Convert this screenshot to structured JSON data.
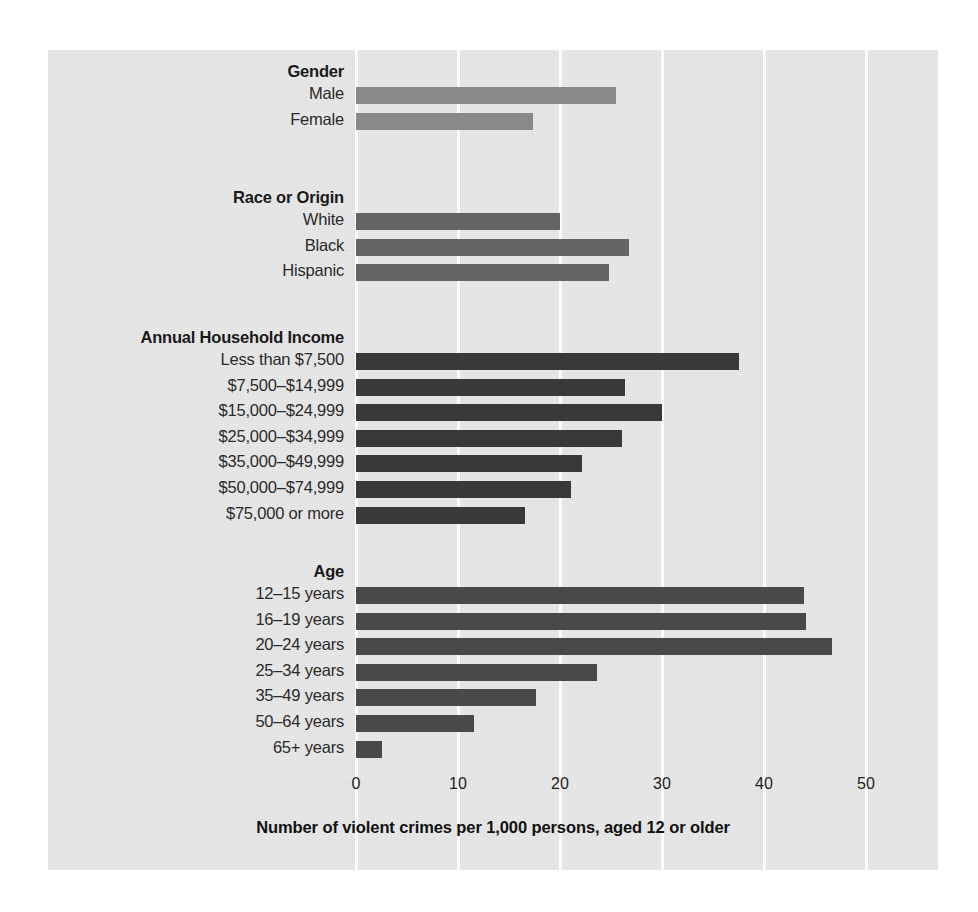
{
  "chart_data": {
    "type": "bar",
    "orientation": "horizontal",
    "title": "",
    "xlabel": "Number of violent crimes per 1,000 persons, aged 12 or older",
    "ylabel": "",
    "xlim": [
      0,
      55
    ],
    "xticks": [
      0,
      10,
      20,
      30,
      40,
      50
    ],
    "xtick_labels": [
      "0",
      "10",
      "20",
      "30",
      "40",
      "50"
    ],
    "grid": "vertical-white-gridlines",
    "legend": "none",
    "background": "#e9e9e9",
    "groups": [
      {
        "name": "Gender",
        "color": "#8c8c8c",
        "categories": [
          "Male",
          "Female"
        ],
        "values": [
          25.5,
          17.4
        ]
      },
      {
        "name": "Race or Origin",
        "color": "#666666",
        "categories": [
          "White",
          "Black",
          "Hispanic"
        ],
        "values": [
          20.0,
          26.8,
          24.8
        ]
      },
      {
        "name": "Annual Household Income",
        "color": "#3a3a3a",
        "categories": [
          "Less than $7,500",
          "$7,500–$14,999",
          "$15,000–$24,999",
          "$25,000–$34,999",
          "$35,000–$49,999",
          "$50,000–$74,999",
          "$75,000 or more"
        ],
        "values": [
          37.5,
          26.4,
          30.0,
          26.1,
          22.2,
          21.1,
          16.6
        ]
      },
      {
        "name": "Age",
        "color": "#4a4a4a",
        "categories": [
          "12–15 years",
          "16–19 years",
          "20–24 years",
          "25–34 years",
          "35–49 years",
          "50–64 years",
          "65+ years"
        ],
        "values": [
          43.9,
          44.1,
          46.7,
          23.6,
          17.6,
          11.6,
          2.5
        ]
      }
    ]
  },
  "axis": {
    "title": "Number of violent crimes per 1,000 persons, aged 12 or older",
    "ticks": [
      "0",
      "10",
      "20",
      "30",
      "40",
      "50"
    ]
  },
  "groups": {
    "gender": {
      "heading": "Gender",
      "rows": [
        {
          "label": "Male",
          "value": 25.5
        },
        {
          "label": "Female",
          "value": 17.4
        }
      ]
    },
    "race": {
      "heading": "Race or Origin",
      "rows": [
        {
          "label": "White",
          "value": 20.0
        },
        {
          "label": "Black",
          "value": 26.8
        },
        {
          "label": "Hispanic",
          "value": 24.8
        }
      ]
    },
    "income": {
      "heading": "Annual Household Income",
      "rows": [
        {
          "label": "Less than $7,500",
          "value": 37.5
        },
        {
          "label": "$7,500–$14,999",
          "value": 26.4
        },
        {
          "label": "$15,000–$24,999",
          "value": 30.0
        },
        {
          "label": "$25,000–$34,999",
          "value": 26.1
        },
        {
          "label": "$35,000–$49,999",
          "value": 22.2
        },
        {
          "label": "$50,000–$74,999",
          "value": 21.1
        },
        {
          "label": "$75,000 or more",
          "value": 16.6
        }
      ]
    },
    "age": {
      "heading": "Age",
      "rows": [
        {
          "label": "12–15 years",
          "value": 43.9
        },
        {
          "label": "16–19 years",
          "value": 44.1
        },
        {
          "label": "20–24 years",
          "value": 46.7
        },
        {
          "label": "25–34 years",
          "value": 23.6
        },
        {
          "label": "35–49 years",
          "value": 17.6
        },
        {
          "label": "50–64 years",
          "value": 11.6
        },
        {
          "label": "65+ years",
          "value": 2.5
        }
      ]
    }
  },
  "colors": {
    "gender_bar": "#8c8c8c",
    "race_bar": "#666666",
    "income_bar": "#3a3a3a",
    "age_bar": "#4a4a4a",
    "panel_background": "#e9e9e9",
    "gridline": "#ffffff",
    "page_background": "#ffffff"
  }
}
